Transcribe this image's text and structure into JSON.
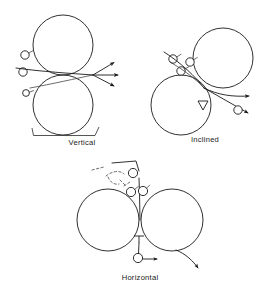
{
  "figure": {
    "background_color": "#ffffff",
    "line_color": "#1a1a1a",
    "panels": [
      {
        "id": "vertical",
        "label": "Vertical",
        "label_x": 82,
        "label_y": 139,
        "has_bracket": true,
        "rolls": [
          {
            "cx": 63,
            "cy": 45,
            "r": 30
          },
          {
            "cx": 63,
            "cy": 105,
            "r": 30
          }
        ],
        "nip": {
          "x": 93,
          "y": 75
        },
        "incoming_particles": [
          {
            "cx": 25,
            "cy": 55,
            "r": 4.2
          },
          {
            "cx": 23,
            "cy": 72,
            "r": 4.2
          },
          {
            "cx": 26,
            "cy": 93,
            "r": 3.4
          }
        ],
        "exit_arrows": [
          {
            "angle_deg": -28,
            "length": 24
          },
          {
            "angle_deg": 0,
            "length": 26
          },
          {
            "angle_deg": 22,
            "length": 24
          }
        ],
        "arrow_count": 3
      },
      {
        "id": "inclined",
        "label": "Inclined",
        "label_x": 205,
        "label_y": 139,
        "has_bracket": false,
        "rolls": [
          {
            "cx": 223,
            "cy": 58,
            "r": 30
          },
          {
            "cx": 181,
            "cy": 105,
            "r": 30
          }
        ],
        "nip": {
          "x": 204,
          "y": 88
        },
        "incoming_particles": [
          {
            "cx": 173,
            "cy": 59,
            "r": 4.2
          },
          {
            "cx": 190,
            "cy": 62,
            "r": 4.2
          },
          {
            "cx": 181,
            "cy": 71,
            "r": 4.2
          }
        ],
        "exit_particles": [
          {
            "cx": 238,
            "cy": 110,
            "r": 4.2
          }
        ],
        "exit_arrows": [
          {
            "angle_deg": 4,
            "length": 50
          },
          {
            "angle_deg": 27,
            "length": 52
          }
        ],
        "arrow_count": 2,
        "has_triangle_marker": true
      },
      {
        "id": "horizontal",
        "label": "Horizontal",
        "label_x": 140,
        "label_y": 277,
        "has_bracket": false,
        "rolls": [
          {
            "cx": 108,
            "cy": 220,
            "r": 31
          },
          {
            "cx": 172,
            "cy": 220,
            "r": 31
          }
        ],
        "nip": {
          "x": 140,
          "y": 220
        },
        "incoming_particles": [
          {
            "cx": 133,
            "cy": 173,
            "r": 4.6
          },
          {
            "cx": 131,
            "cy": 192,
            "r": 4.6
          },
          {
            "cx": 143,
            "cy": 191,
            "r": 4.6
          }
        ],
        "exit_particles": [
          {
            "cx": 138,
            "cy": 258,
            "r": 4.6
          }
        ],
        "exit_arrows": [
          {
            "angle_deg": 0,
            "length": 16
          },
          {
            "angle_deg": 35,
            "length": 30
          }
        ],
        "arrow_count": 2,
        "has_dashed_spray": true,
        "has_triangle_marker": true
      }
    ]
  }
}
